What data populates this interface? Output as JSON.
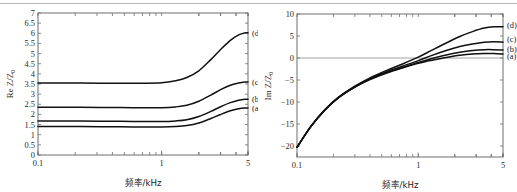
{
  "figure": {
    "caption_visible": false,
    "background": "#ffffff",
    "curve_color": "#111111",
    "axis_color": "#6e6e6e",
    "artifact_line_top": true
  },
  "chart_data": [
    {
      "id": "left",
      "type": "line",
      "title": "",
      "xlabel": "频率/kHz",
      "ylabel": "Re Z/Z",
      "ylabel_sub": "0",
      "xscale": "log",
      "xlim": [
        0.1,
        5
      ],
      "ylim": [
        0,
        7
      ],
      "xticks": [
        0.1,
        1,
        5
      ],
      "xticklabels": [
        "0.1",
        "1",
        "5"
      ],
      "yticks": [
        0,
        0.5,
        1,
        1.5,
        2,
        2.5,
        3,
        3.5,
        4,
        4.5,
        5,
        5.5,
        6,
        6.5,
        7
      ],
      "yticklabels": [
        "0",
        "0.5",
        "1",
        "1.5",
        "2",
        "2.5",
        "3",
        "3.5",
        "4",
        "4.5",
        "5",
        "5.5",
        "6",
        "6.5",
        "7"
      ],
      "grid": false,
      "legend_position": "right-inline",
      "series": [
        {
          "name": "(a)",
          "label": "(a)",
          "x": [
            0.1,
            0.15,
            0.22,
            0.32,
            0.46,
            0.68,
            1.0,
            1.3,
            1.6,
            2.0,
            2.5,
            3.0,
            3.6,
            4.2,
            4.7,
            5.0
          ],
          "values": [
            1.4,
            1.4,
            1.4,
            1.39,
            1.39,
            1.38,
            1.38,
            1.4,
            1.45,
            1.58,
            1.8,
            2.0,
            2.18,
            2.28,
            2.32,
            2.32
          ]
        },
        {
          "name": "(b)",
          "label": "(b)",
          "x": [
            0.1,
            0.15,
            0.22,
            0.32,
            0.46,
            0.68,
            1.0,
            1.3,
            1.6,
            2.0,
            2.5,
            3.0,
            3.6,
            4.2,
            4.7,
            5.0
          ],
          "values": [
            1.67,
            1.67,
            1.67,
            1.66,
            1.66,
            1.65,
            1.65,
            1.68,
            1.74,
            1.9,
            2.15,
            2.38,
            2.58,
            2.7,
            2.75,
            2.75
          ]
        },
        {
          "name": "(c)",
          "label": "(c)",
          "x": [
            0.1,
            0.15,
            0.22,
            0.32,
            0.46,
            0.68,
            1.0,
            1.3,
            1.6,
            2.0,
            2.5,
            3.0,
            3.6,
            4.2,
            4.7,
            5.0
          ],
          "values": [
            2.35,
            2.35,
            2.35,
            2.34,
            2.34,
            2.33,
            2.33,
            2.37,
            2.45,
            2.65,
            2.95,
            3.22,
            3.44,
            3.55,
            3.6,
            3.6
          ]
        },
        {
          "name": "(d)",
          "label": "(d)",
          "x": [
            0.1,
            0.15,
            0.22,
            0.32,
            0.46,
            0.68,
            1.0,
            1.3,
            1.6,
            2.0,
            2.5,
            3.0,
            3.6,
            4.2,
            4.7,
            5.0
          ],
          "values": [
            3.55,
            3.55,
            3.55,
            3.54,
            3.54,
            3.54,
            3.56,
            3.66,
            3.82,
            4.15,
            4.7,
            5.2,
            5.65,
            5.92,
            6.02,
            6.02
          ]
        }
      ]
    },
    {
      "id": "right",
      "type": "line",
      "title": "",
      "xlabel": "频率/kHz",
      "ylabel": "Im Z/Z",
      "ylabel_sub": "0",
      "xscale": "log",
      "xlim": [
        0.1,
        5
      ],
      "ylim": [
        -22.5,
        10
      ],
      "xticks": [
        0.1,
        1,
        5
      ],
      "xticklabels": [
        "0.1",
        "1",
        "5"
      ],
      "yticks": [
        -20,
        -15,
        -10,
        -5,
        0,
        5,
        10
      ],
      "yticklabels": [
        "−20",
        "−15",
        "−10",
        "−5",
        "0",
        "5",
        "10"
      ],
      "grid": false,
      "zero_line": true,
      "legend_position": "right-inline",
      "series": [
        {
          "name": "(a)",
          "label": "(a)",
          "x": [
            0.1,
            0.13,
            0.17,
            0.22,
            0.3,
            0.4,
            0.55,
            0.75,
            1.0,
            1.3,
            1.7,
            2.2,
            2.8,
            3.5,
            4.2,
            5.0
          ],
          "values": [
            -20.3,
            -15.6,
            -11.8,
            -9.0,
            -6.6,
            -4.9,
            -3.4,
            -2.2,
            -1.2,
            -0.5,
            0.1,
            0.6,
            0.9,
            1.0,
            1.0,
            0.9
          ]
        },
        {
          "name": "(b)",
          "label": "(b)",
          "x": [
            0.1,
            0.13,
            0.17,
            0.22,
            0.3,
            0.4,
            0.55,
            0.75,
            1.0,
            1.3,
            1.7,
            2.2,
            2.8,
            3.5,
            4.2,
            5.0
          ],
          "values": [
            -20.3,
            -15.6,
            -11.8,
            -9.0,
            -6.6,
            -4.8,
            -3.3,
            -2.1,
            -1.0,
            -0.1,
            0.7,
            1.3,
            1.7,
            1.9,
            1.9,
            1.8
          ]
        },
        {
          "name": "(c)",
          "label": "(c)",
          "x": [
            0.1,
            0.13,
            0.17,
            0.22,
            0.3,
            0.4,
            0.55,
            0.75,
            1.0,
            1.3,
            1.7,
            2.2,
            2.8,
            3.5,
            4.2,
            5.0
          ],
          "values": [
            -20.3,
            -15.6,
            -11.8,
            -9.0,
            -6.5,
            -4.7,
            -3.1,
            -1.8,
            -0.6,
            0.6,
            1.7,
            2.6,
            3.2,
            3.6,
            3.7,
            3.6
          ]
        },
        {
          "name": "(d)",
          "label": "(d)",
          "x": [
            0.1,
            0.13,
            0.17,
            0.22,
            0.3,
            0.4,
            0.55,
            0.75,
            1.0,
            1.3,
            1.7,
            2.2,
            2.8,
            3.5,
            4.2,
            5.0
          ],
          "values": [
            -20.3,
            -15.5,
            -11.7,
            -8.9,
            -6.4,
            -4.5,
            -2.8,
            -1.3,
            0.2,
            1.8,
            3.4,
            4.9,
            6.0,
            6.8,
            7.1,
            7.1
          ]
        }
      ]
    }
  ]
}
